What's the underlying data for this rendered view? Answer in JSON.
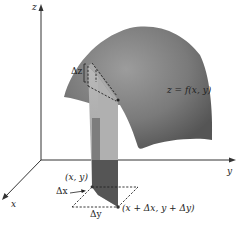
{
  "figure": {
    "type": "3d-surface-volume-element",
    "axes": {
      "z_label": "z",
      "y_label": "y",
      "x_label": "x"
    },
    "labels": {
      "surface": "z = f(x, y)",
      "delta_z": "Δz",
      "point_xy": "(x, y)",
      "point_dx_dy": "(x + Δx, y + Δy)",
      "delta_x": "Δx",
      "delta_y": "Δy"
    },
    "colors": {
      "surface_dark": "#5a5a5a",
      "surface_light": "#9a9a9a",
      "column_light": "#a8a8a8",
      "column_dark": "#4a4a4a",
      "axis": "#333333",
      "background": "#ffffff"
    }
  }
}
